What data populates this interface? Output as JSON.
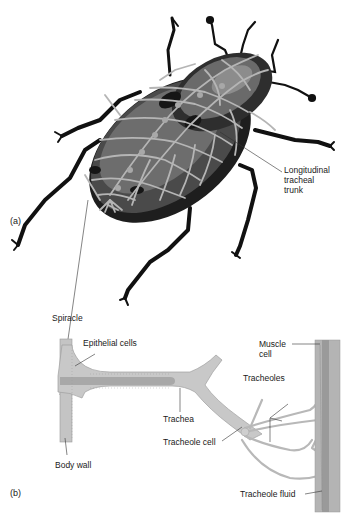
{
  "figure": {
    "panel_a": {
      "label": "(a)",
      "subject": "beetle tracheal system",
      "callouts": {
        "longitudinal_trunk_line1": "Longitudinal",
        "longitudinal_trunk_line2": "tracheal",
        "longitudinal_trunk_line3": "trunk"
      }
    },
    "panel_b": {
      "label": "(b)",
      "callouts": {
        "spiracle": "Spiracle",
        "epithelial_cells": "Epithelial cells",
        "body_wall": "Body wall",
        "trachea": "Trachea",
        "tracheole_cell": "Tracheole cell",
        "muscle_cell_line1": "Muscle",
        "muscle_cell_line2": "cell",
        "tracheoles": "Tracheoles",
        "tracheole_fluid": "Tracheole fluid"
      }
    },
    "colors": {
      "background": "#ffffff",
      "beetle_dark": "#2a2a2a",
      "beetle_mid": "#5c5c5c",
      "beetle_light": "#8a8a8a",
      "trachea_gray": "#b8b8b8",
      "tissue_light": "#c9c9c9",
      "tissue_mid": "#a9a9a9",
      "leader_line": "#333333"
    }
  }
}
